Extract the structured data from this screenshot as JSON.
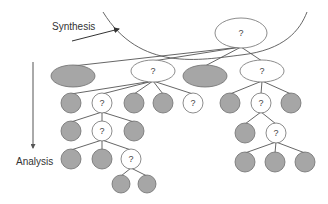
{
  "labels": {
    "synthesis": "Synthesis",
    "analysis": "Analysis"
  },
  "unknown_mark": "?",
  "colors": {
    "grey_fill": "#a6a6a6",
    "stroke": "#6f6f6f",
    "edge": "#555555",
    "text": "#333333"
  },
  "nodes": [
    {
      "id": "root",
      "shape": "ellipse",
      "cx": 241,
      "cy": 33,
      "rx": 26,
      "ry": 15,
      "fill": "white",
      "label": "?"
    },
    {
      "id": "l1a",
      "shape": "ellipse",
      "cx": 73,
      "cy": 76,
      "rx": 22,
      "ry": 11,
      "fill": "grey",
      "label": ""
    },
    {
      "id": "l1b",
      "shape": "ellipse",
      "cx": 153,
      "cy": 71,
      "rx": 22,
      "ry": 11,
      "fill": "white",
      "label": "?"
    },
    {
      "id": "l1c",
      "shape": "ellipse",
      "cx": 205,
      "cy": 76,
      "rx": 22,
      "ry": 11,
      "fill": "grey",
      "label": ""
    },
    {
      "id": "l1d",
      "shape": "ellipse",
      "cx": 262,
      "cy": 71,
      "rx": 22,
      "ry": 11,
      "fill": "white",
      "label": "?"
    },
    {
      "id": "b1",
      "shape": "circle",
      "cx": 71,
      "cy": 103,
      "r": 10,
      "fill": "grey",
      "label": ""
    },
    {
      "id": "b2",
      "shape": "circle",
      "cx": 102,
      "cy": 103,
      "r": 10,
      "fill": "white",
      "label": "?"
    },
    {
      "id": "b3",
      "shape": "circle",
      "cx": 134,
      "cy": 103,
      "r": 10,
      "fill": "grey",
      "label": ""
    },
    {
      "id": "b4",
      "shape": "circle",
      "cx": 163,
      "cy": 103,
      "r": 10,
      "fill": "grey",
      "label": ""
    },
    {
      "id": "b5",
      "shape": "circle",
      "cx": 193,
      "cy": 103,
      "r": 10,
      "fill": "white",
      "label": "?"
    },
    {
      "id": "c1",
      "shape": "circle",
      "cx": 230,
      "cy": 103,
      "r": 10,
      "fill": "grey",
      "label": ""
    },
    {
      "id": "c2",
      "shape": "circle",
      "cx": 261,
      "cy": 103,
      "r": 10,
      "fill": "white",
      "label": "?"
    },
    {
      "id": "c3",
      "shape": "circle",
      "cx": 291,
      "cy": 103,
      "r": 10,
      "fill": "grey",
      "label": ""
    },
    {
      "id": "d1",
      "shape": "circle",
      "cx": 71,
      "cy": 131,
      "r": 10,
      "fill": "grey",
      "label": ""
    },
    {
      "id": "d2",
      "shape": "circle",
      "cx": 102,
      "cy": 131,
      "r": 10,
      "fill": "white",
      "label": "?"
    },
    {
      "id": "d3",
      "shape": "circle",
      "cx": 134,
      "cy": 131,
      "r": 10,
      "fill": "grey",
      "label": ""
    },
    {
      "id": "e1",
      "shape": "circle",
      "cx": 245,
      "cy": 133,
      "r": 10,
      "fill": "grey",
      "label": ""
    },
    {
      "id": "e2",
      "shape": "circle",
      "cx": 276,
      "cy": 133,
      "r": 10,
      "fill": "white",
      "label": "?"
    },
    {
      "id": "f1",
      "shape": "circle",
      "cx": 71,
      "cy": 159,
      "r": 10,
      "fill": "grey",
      "label": ""
    },
    {
      "id": "f2",
      "shape": "circle",
      "cx": 102,
      "cy": 159,
      "r": 10,
      "fill": "grey",
      "label": ""
    },
    {
      "id": "f3",
      "shape": "circle",
      "cx": 131,
      "cy": 159,
      "r": 10,
      "fill": "white",
      "label": "?"
    },
    {
      "id": "g1",
      "shape": "circle",
      "cx": 245,
      "cy": 162,
      "r": 10,
      "fill": "grey",
      "label": ""
    },
    {
      "id": "g2",
      "shape": "circle",
      "cx": 275,
      "cy": 162,
      "r": 10,
      "fill": "grey",
      "label": ""
    },
    {
      "id": "g3",
      "shape": "circle",
      "cx": 305,
      "cy": 162,
      "r": 10,
      "fill": "grey",
      "label": ""
    },
    {
      "id": "h1",
      "shape": "circle",
      "cx": 121,
      "cy": 184,
      "r": 9,
      "fill": "grey",
      "label": ""
    },
    {
      "id": "h2",
      "shape": "circle",
      "cx": 147,
      "cy": 184,
      "r": 9,
      "fill": "grey",
      "label": ""
    }
  ],
  "edges": [
    [
      "root",
      "l1a"
    ],
    [
      "root",
      "l1b"
    ],
    [
      "root",
      "l1c"
    ],
    [
      "root",
      "l1d"
    ],
    [
      "l1b",
      "b1"
    ],
    [
      "l1b",
      "b2"
    ],
    [
      "l1b",
      "b3"
    ],
    [
      "l1b",
      "b4"
    ],
    [
      "l1b",
      "b5"
    ],
    [
      "l1d",
      "c1"
    ],
    [
      "l1d",
      "c2"
    ],
    [
      "l1d",
      "c3"
    ],
    [
      "b2",
      "d1"
    ],
    [
      "b2",
      "d2"
    ],
    [
      "b2",
      "d3"
    ],
    [
      "c2",
      "e1"
    ],
    [
      "c2",
      "e2"
    ],
    [
      "d2",
      "f1"
    ],
    [
      "d2",
      "f2"
    ],
    [
      "d2",
      "f3"
    ],
    [
      "e2",
      "g1"
    ],
    [
      "e2",
      "g2"
    ],
    [
      "e2",
      "g3"
    ],
    [
      "f3",
      "h1"
    ],
    [
      "f3",
      "h2"
    ]
  ]
}
